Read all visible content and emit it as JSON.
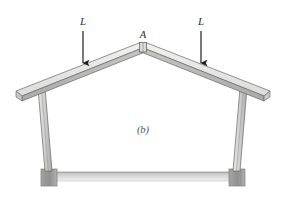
{
  "figure": {
    "part_label": "(b)",
    "apex_label": "A",
    "loads": [
      {
        "name": "left-load",
        "label": "L",
        "x": 83,
        "arrow_top_y": 30,
        "arrow_bottom_y": 64
      },
      {
        "name": "right-load",
        "label": "L",
        "x": 200,
        "arrow_top_y": 30,
        "arrow_bottom_y": 64
      }
    ],
    "colors": {
      "beam_top_face": "#e2e2e0",
      "beam_side_face": "#b9b9b7",
      "column_face": "#d6d6d4",
      "column_shade": "#a8a8a6",
      "footing": "#9b9b99",
      "slab": "#c9c9c7",
      "outline": "#6d6d6b",
      "arrow": "#1f1f1f",
      "text": "#2b2b2b",
      "background": "#ffffff"
    },
    "geometry": {
      "apex_x": 143,
      "apex_y": 44,
      "left_eave_x": 18,
      "left_eave_y": 95,
      "right_eave_x": 268,
      "right_eave_y": 95,
      "left_column_x_top": 42,
      "left_column_x_base": 48,
      "right_column_x_top": 243,
      "right_column_x_base": 238,
      "base_y": 172,
      "ground_y": 185
    },
    "icons": {
      "down_arrow": "down-arrow-icon"
    }
  }
}
